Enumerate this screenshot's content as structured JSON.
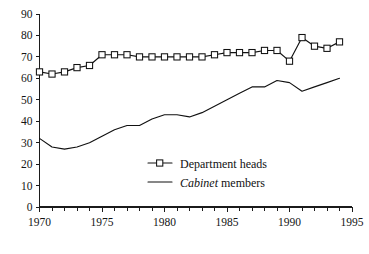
{
  "chart_data": {
    "type": "line",
    "title": "",
    "subtitle": "",
    "xlabel": "",
    "ylabel": "",
    "xlim": [
      1970,
      1995
    ],
    "ylim": [
      0,
      90
    ],
    "grid": false,
    "legend_position": "center",
    "y_ticks": [
      0,
      10,
      20,
      30,
      40,
      50,
      60,
      70,
      80,
      90
    ],
    "x_ticks": [
      1970,
      1975,
      1980,
      1985,
      1990,
      1995
    ],
    "x_tick_labels": [
      "1970",
      "1975",
      "1980",
      "1985",
      "1990",
      "1995"
    ],
    "y_tick_labels": [
      "0",
      "10",
      "20",
      "30",
      "40",
      "50",
      "60",
      "70",
      "80",
      "90"
    ],
    "x_minor_tick_interval": 1,
    "x": [
      1970,
      1971,
      1972,
      1973,
      1974,
      1975,
      1976,
      1977,
      1978,
      1979,
      1980,
      1981,
      1982,
      1983,
      1984,
      1985,
      1986,
      1987,
      1988,
      1989,
      1990,
      1991,
      1992,
      1993,
      1994
    ],
    "series": [
      {
        "name": "Department heads",
        "marker": "open-square",
        "line_style": "solid",
        "color": "#111111",
        "values": [
          63,
          62,
          63,
          65,
          66,
          71,
          71,
          71,
          70,
          70,
          70,
          70,
          70,
          70,
          71,
          72,
          72,
          72,
          73,
          73,
          68,
          79,
          75,
          74,
          77
        ]
      },
      {
        "name": "Cabinet members",
        "name_italic_word": "Cabinet",
        "marker": "none",
        "line_style": "solid",
        "color": "#111111",
        "values": [
          32,
          28,
          27,
          28,
          30,
          33,
          36,
          38,
          38,
          41,
          43,
          43,
          42,
          44,
          47,
          50,
          53,
          56,
          56,
          59,
          58,
          54,
          56,
          58,
          60
        ]
      }
    ],
    "annotations": []
  },
  "legend": {
    "items": [
      {
        "label": "Department heads",
        "marker": "open-square",
        "italic_prefix": ""
      },
      {
        "label": " members",
        "marker": "line",
        "italic_prefix": "Cabinet"
      }
    ]
  }
}
